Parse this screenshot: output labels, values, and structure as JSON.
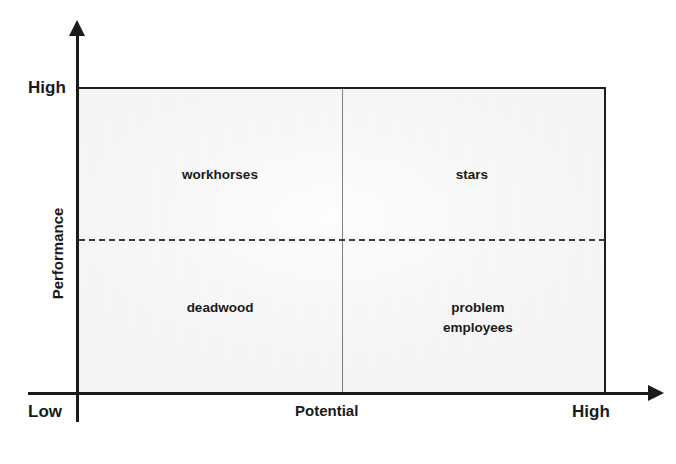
{
  "chart_data": {
    "type": "scatter",
    "title": "",
    "xlabel": "Potential",
    "ylabel": "Performance",
    "xlim": [
      "Low",
      "High"
    ],
    "ylim": [
      "Low",
      "High"
    ],
    "grid": false,
    "legend": "none",
    "quadrants": [
      {
        "id": "workhorses",
        "label": "workhorses",
        "x_band": "low potential",
        "y_band": "high performance"
      },
      {
        "id": "stars",
        "label": "stars",
        "x_band": "high potential",
        "y_band": "high performance"
      },
      {
        "id": "deadwood",
        "label": "deadwood",
        "x_band": "low potential",
        "y_band": "low performance"
      },
      {
        "id": "problem-employees",
        "label": "problem\nemployees",
        "x_band": "high potential",
        "y_band": "low performance"
      }
    ],
    "dividers": {
      "vertical": {
        "style": "solid",
        "position": "mid-x"
      },
      "horizontal": {
        "style": "dashed",
        "position": "mid-y"
      }
    }
  },
  "axes": {
    "y": {
      "title": "Performance",
      "high_label": "High",
      "low_label": "Low"
    },
    "x": {
      "title": "Potential",
      "high_label": "High"
    }
  },
  "quadrant_labels": {
    "top_left": "workhorses",
    "top_right": "stars",
    "bottom_left": "deadwood",
    "bottom_right": "problem\nemployees"
  },
  "colors": {
    "plot_fill": "#f2f2f2",
    "axis": "#1a1a1a",
    "divider_solid": "#808080",
    "divider_dashed": "#3a3a3a",
    "text": "#1a1a1a",
    "page_background": "#ffffff"
  }
}
